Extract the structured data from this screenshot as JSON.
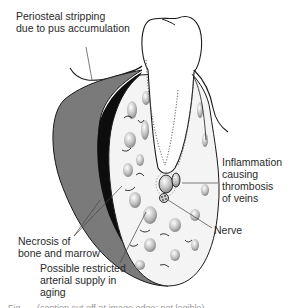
{
  "figure": {
    "labels": [
      {
        "id": "periosteal",
        "text": "Periosteal stripping\ndue to pus accumulation"
      },
      {
        "id": "necrosis",
        "text": "Necrosis of\nbone and marrow"
      },
      {
        "id": "arterial",
        "text": "Possible restricted\narterial supply in\naging"
      },
      {
        "id": "inflammation",
        "text": "Inflammation\ncausing\nthrombosis\nof veins"
      },
      {
        "id": "nerve",
        "text": "Nerve"
      }
    ],
    "caption": {
      "text": "Fig. — (caption cut off at image edge; not legible)",
      "visible": "partial"
    },
    "colors": {
      "outline": "#1a1a1a",
      "pus_layer": "#7a7a7a",
      "necrotic_cortex": "#0d0d0d",
      "marrow": "#e6e6e6",
      "label_text": "#2a2a2a"
    }
  }
}
